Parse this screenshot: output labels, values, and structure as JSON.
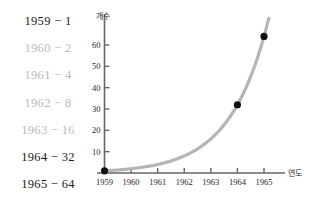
{
  "sequence_list": {
    "items": [
      {
        "label": "1959 − 1",
        "emphasis": "dark"
      },
      {
        "label": "1960 − 2",
        "emphasis": "light"
      },
      {
        "label": "1961 − 4",
        "emphasis": "light"
      },
      {
        "label": "1962 − 8",
        "emphasis": "light"
      },
      {
        "label": "1963 − 16",
        "emphasis": "light"
      },
      {
        "label": "1964 − 32",
        "emphasis": "dark"
      },
      {
        "label": "1965 − 64",
        "emphasis": "dark"
      }
    ]
  },
  "colors": {
    "curve": "#b5b5b5",
    "axis": "#666666",
    "point": "#111111",
    "text_dark": "#1a1a1a",
    "text_light": "#b9b9b9"
  },
  "chart_data": {
    "type": "line",
    "title": "",
    "xlabel": "연도",
    "ylabel": "개수",
    "x": [
      1959,
      1960,
      1961,
      1962,
      1963,
      1964,
      1965
    ],
    "xticklabels": [
      "1959",
      "1960",
      "1961",
      "1962",
      "1963",
      "1964",
      "1965"
    ],
    "yticks": [
      10,
      20,
      30,
      40,
      50,
      60
    ],
    "yticklabels": [
      "10",
      "20",
      "30",
      "40",
      "50",
      "60"
    ],
    "xlim": [
      1959,
      1965
    ],
    "ylim": [
      0,
      68
    ],
    "grid": false,
    "legend": false,
    "series": [
      {
        "name": "개수",
        "values": [
          1,
          2,
          4,
          8,
          16,
          32,
          64
        ],
        "style": "smooth-curve",
        "color": "#b5b5b5"
      }
    ],
    "marked_points": [
      {
        "x": 1959,
        "y": 1,
        "label": "1959 − 1"
      },
      {
        "x": 1964,
        "y": 32,
        "label": "1964 − 32"
      },
      {
        "x": 1965,
        "y": 64,
        "label": "1965 − 64"
      }
    ]
  }
}
